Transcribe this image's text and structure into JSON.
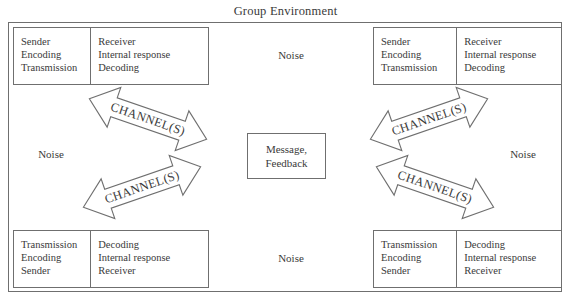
{
  "diagram": {
    "title": "Group Environment",
    "frame_name": "group-environment-frame",
    "border_color": "#6f6f6f",
    "text_color": "#3a3a3a",
    "background": "#ffffff"
  },
  "groups": {
    "top_left": {
      "left_cell": [
        "Sender",
        "Encoding",
        "Transmission"
      ],
      "right_cell": [
        "Receiver",
        "Internal response",
        "Decoding"
      ]
    },
    "top_right": {
      "left_cell": [
        "Sender",
        "Encoding",
        "Transmission"
      ],
      "right_cell": [
        "Receiver",
        "Internal response",
        "Decoding"
      ]
    },
    "bottom_left": {
      "left_cell": [
        "Transmission",
        "Encoding",
        "Sender"
      ],
      "right_cell": [
        "Decoding",
        "Internal response",
        "Receiver"
      ]
    },
    "bottom_right": {
      "left_cell": [
        "Transmission",
        "Encoding",
        "Sender"
      ],
      "right_cell": [
        "Decoding",
        "Internal response",
        "Receiver"
      ]
    }
  },
  "noise": {
    "top": "Noise",
    "left": "Noise",
    "right": "Noise",
    "bottom": "Noise"
  },
  "message_box": {
    "line1": "Message,",
    "line2": "Feedback"
  },
  "arrows": {
    "label": "CHANNEL(S)",
    "top_left": "CHANNEL(S)",
    "bottom_left": "CHANNEL(S)",
    "top_right": "CHANNEL(S)",
    "bottom_right": "CHANNEL(S)"
  }
}
